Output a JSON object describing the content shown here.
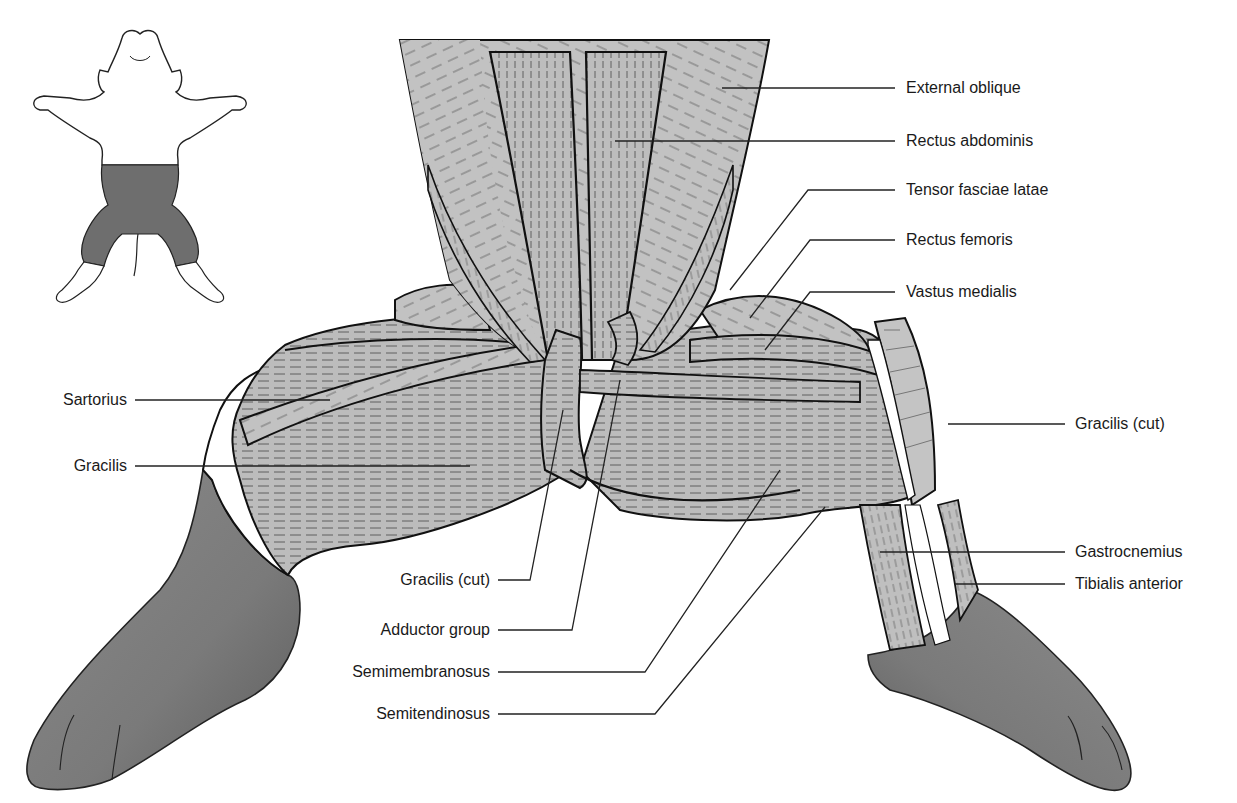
{
  "figure": {
    "colors": {
      "background": "#ffffff",
      "muscle_fill": "#b9b9b9",
      "muscle_light": "#c8c8c8",
      "skin_fill": "#7a7a7a",
      "outline": "#111111",
      "leader_line": "#222222",
      "inset_shade": "#6e6e6e"
    },
    "inset": {
      "description": "Whole-body outline with shaded dissection region (lower abdomen and thighs)"
    },
    "labels_right": [
      {
        "id": "external-oblique",
        "text": "External oblique",
        "x": 906,
        "y": 79
      },
      {
        "id": "rectus-abdominis",
        "text": "Rectus abdominis",
        "x": 906,
        "y": 132
      },
      {
        "id": "tensor-fasciae-latae",
        "text": "Tensor fasciae latae",
        "x": 906,
        "y": 180
      },
      {
        "id": "rectus-femoris",
        "text": "Rectus femoris",
        "x": 906,
        "y": 230
      },
      {
        "id": "vastus-medialis",
        "text": "Vastus medialis",
        "x": 906,
        "y": 282
      },
      {
        "id": "gracilis-cut-right",
        "text": "Gracilis (cut)",
        "x": 1075,
        "y": 414
      },
      {
        "id": "gastrocnemius",
        "text": "Gastrocnemius",
        "x": 1075,
        "y": 542
      },
      {
        "id": "tibialis-anterior",
        "text": "Tibialis anterior",
        "x": 1075,
        "y": 574
      }
    ],
    "labels_left": [
      {
        "id": "sartorius",
        "text": "Sartorius",
        "right": 127,
        "y": 390
      },
      {
        "id": "gracilis",
        "text": "Gracilis",
        "right": 127,
        "y": 456
      },
      {
        "id": "gracilis-cut-left",
        "text": "Gracilis (cut)",
        "right": 490,
        "y": 569
      },
      {
        "id": "adductor-group",
        "text": "Adductor group",
        "right": 490,
        "y": 620
      },
      {
        "id": "semimembranosus",
        "text": "Semimembranosus",
        "right": 490,
        "y": 662
      },
      {
        "id": "semitendinosus",
        "text": "Semitendinosus",
        "right": 490,
        "y": 704
      }
    ]
  }
}
